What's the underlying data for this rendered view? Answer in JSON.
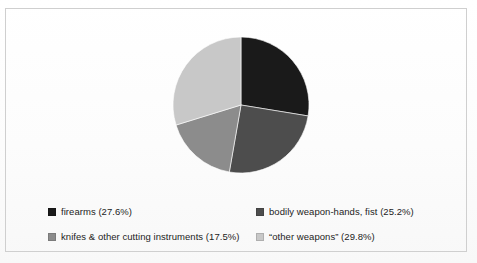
{
  "figure": {
    "background_color": "#fdfdfd",
    "frame_border_color": "#cfcfcf"
  },
  "chart_data": {
    "type": "pie",
    "title": "",
    "subtitle": "",
    "xlabel": "",
    "ylabel": "",
    "grid": false,
    "legend_position": "bottom",
    "start_angle_deg": 0,
    "direction": "clockwise",
    "categories": [
      "firearms",
      "bodily weapon-hands, fist",
      "knifes & other cutting instruments",
      "“other weapons”"
    ],
    "values": [
      27.6,
      25.2,
      17.5,
      29.8
    ],
    "value_unit": "%",
    "colors": [
      "#1a1a1a",
      "#4d4d4d",
      "#8c8c8c",
      "#c8c8c8"
    ],
    "slices": [
      {
        "label": "firearms",
        "value": 27.6,
        "display": "firearms (27.6%)",
        "color": "#1a1a1a",
        "start_deg": 0.0,
        "end_deg": 99.36
      },
      {
        "label": "bodily weapon-hands, fist",
        "value": 25.2,
        "display": "bodily weapon-hands, fist (25.2%)",
        "color": "#4d4d4d",
        "start_deg": 99.36,
        "end_deg": 190.08
      },
      {
        "label": "knifes & other cutting instruments",
        "value": 17.5,
        "display": "knifes & other cutting instruments (17.5%)",
        "color": "#8c8c8c",
        "start_deg": 190.08,
        "end_deg": 253.08
      },
      {
        "label": "“other weapons”",
        "value": 29.8,
        "display": "“other weapons” (29.8%)",
        "color": "#c8c8c8",
        "start_deg": 253.08,
        "end_deg": 360.0
      }
    ]
  },
  "legend": {
    "entries": [
      {
        "label": "firearms (27.6%)",
        "color": "#1a1a1a"
      },
      {
        "label": "bodily weapon-hands, fist (25.2%)",
        "color": "#4d4d4d"
      },
      {
        "label": "knifes & other cutting instruments (17.5%)",
        "color": "#8c8c8c"
      },
      {
        "label": "“other weapons” (29.8%)",
        "color": "#c8c8c8"
      }
    ]
  }
}
